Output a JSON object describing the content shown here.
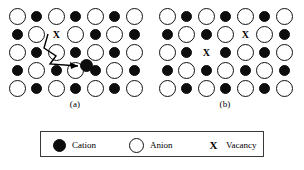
{
  "figure": {
    "panels": [
      {
        "id": "panel-a",
        "subcaption": "(a)",
        "defect_type": "frenkel",
        "grid": {
          "columns": 7,
          "rows": 5,
          "cell_width": 19.5,
          "cell_height": 18.0,
          "origin_x": 1.5,
          "origin_y": 3.0,
          "cells": [
            [
              "anion",
              "cation",
              "anion",
              "cation",
              "anion",
              "cation",
              "anion"
            ],
            [
              "cation",
              "anion",
              "vacancy",
              "anion",
              "cation",
              "anion",
              "cation"
            ],
            [
              "anion",
              "cation",
              "anion",
              "cation",
              "anion",
              "cation",
              "anion"
            ],
            [
              "cation",
              "anion",
              "cation",
              "anion",
              "cation",
              "anion",
              "cation"
            ],
            [
              "anion",
              "cation",
              "anion",
              "cation",
              "anion",
              "cation",
              "anion"
            ]
          ]
        },
        "vacancy_marks": [
          {
            "row": 1,
            "col": 2,
            "glyph": "X"
          }
        ],
        "interstitial": {
          "label": "interstitial-cation",
          "x": 79,
          "y": 60
        },
        "migration_path": {
          "label": "cation-migration-arrow",
          "points": "42,30 38,44 50,52 44,60 72,62",
          "arrow_head": "72,62 64,58 65,65"
        }
      },
      {
        "id": "panel-b",
        "subcaption": "(b)",
        "defect_type": "schottky",
        "grid": {
          "columns": 7,
          "rows": 5,
          "cell_width": 19.5,
          "cell_height": 18.0,
          "origin_x": 1.5,
          "origin_y": 3.0,
          "cells": [
            [
              "anion",
              "cation",
              "anion",
              "cation",
              "anion",
              "cation",
              "anion"
            ],
            [
              "cation",
              "anion",
              "cation",
              "anion",
              "vacancy",
              "anion",
              "cation"
            ],
            [
              "anion",
              "cation",
              "vacancy",
              "cation",
              "anion",
              "cation",
              "anion"
            ],
            [
              "cation",
              "anion",
              "cation",
              "anion",
              "cation",
              "anion",
              "cation"
            ],
            [
              "anion",
              "cation",
              "anion",
              "cation",
              "anion",
              "cation",
              "anion"
            ]
          ]
        },
        "vacancy_marks": [
          {
            "row": 1,
            "col": 4,
            "glyph": "X"
          },
          {
            "row": 2,
            "col": 2,
            "glyph": "X"
          }
        ],
        "interstitial": null,
        "migration_path": null
      }
    ],
    "legend": {
      "entries": [
        {
          "symbol": "filled-circle",
          "label": "Cation"
        },
        {
          "symbol": "open-circle",
          "label": "Anion"
        },
        {
          "symbol": "X",
          "label": "Vacancy"
        }
      ],
      "vacancy_glyph": "X"
    },
    "colors": {
      "cation_fill": "#0d0d0d",
      "anion_fill": "#ffffff",
      "anion_stroke": "#111111",
      "legend_border": "#3a3a3a",
      "background": "#ffffff",
      "text": "#000000"
    }
  }
}
